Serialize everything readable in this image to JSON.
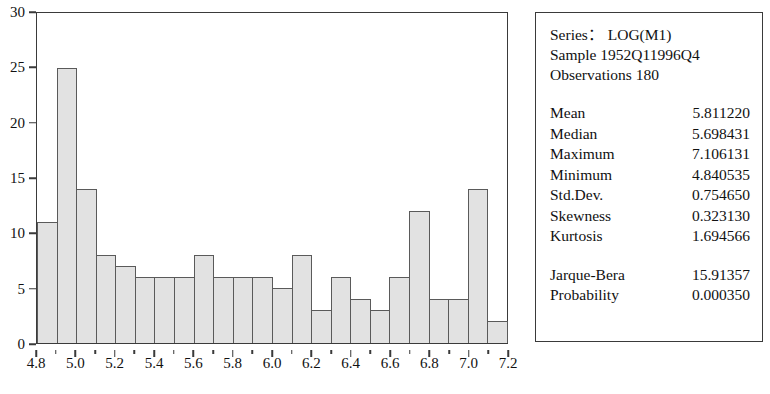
{
  "chart_data": {
    "type": "bar",
    "title": "",
    "xlabel": "",
    "ylabel": "",
    "ylim": [
      0,
      30
    ],
    "xlim": [
      4.75,
      7.15
    ],
    "grid": false,
    "legend": null,
    "bin_width": 0.1,
    "categories": [
      "4.75",
      "4.85",
      "4.95",
      "5.05",
      "5.15",
      "5.25",
      "5.35",
      "5.45",
      "5.55",
      "5.65",
      "5.75",
      "5.85",
      "5.95",
      "6.05",
      "6.15",
      "6.25",
      "6.35",
      "6.45",
      "6.55",
      "6.65",
      "6.75",
      "6.85",
      "6.95",
      "7.05"
    ],
    "values": [
      11,
      25,
      14,
      8,
      7,
      6,
      6,
      6,
      8,
      6,
      6,
      6,
      5,
      8,
      3,
      6,
      4,
      3,
      6,
      12,
      4,
      4,
      14,
      2
    ],
    "y_ticks": [
      "0",
      "5",
      "10",
      "15",
      "20",
      "25",
      "30"
    ],
    "y_tick_values": [
      0,
      5,
      10,
      15,
      20,
      25,
      30
    ],
    "x_ticks": [
      "4.8",
      "5.0",
      "5.2",
      "5.4",
      "5.6",
      "5.8",
      "6.0",
      "6.2",
      "6.4",
      "6.6",
      "6.8",
      "7.0",
      "7.2"
    ],
    "x_tick_values": [
      4.8,
      5.0,
      5.2,
      5.4,
      5.6,
      5.8,
      6.0,
      6.2,
      6.4,
      6.6,
      6.8,
      7.0,
      7.2
    ],
    "bar_fill_color": "#e2e2e2",
    "bar_border_color": "#5a5a5a",
    "axis_color": "#3a3a3a"
  },
  "stats": {
    "series_line": "Series： LOG(M1)",
    "sample_line": "Sample 1952Q11996Q4",
    "observations_line": "Observations 180",
    "rows": [
      {
        "label": "Mean",
        "value": "5.811220"
      },
      {
        "label": "Median",
        "value": "5.698431"
      },
      {
        "label": "Maximum",
        "value": "7.106131"
      },
      {
        "label": "Minimum",
        "value": "4.840535"
      },
      {
        "label": "Std.Dev.",
        "value": "0.754650"
      },
      {
        "label": "Skewness",
        "value": "0.323130"
      },
      {
        "label": "Kurtosis",
        "value": "1.694566"
      }
    ],
    "test_rows": [
      {
        "label": "Jarque-Bera",
        "value": "15.91357"
      },
      {
        "label": "Probability",
        "value": "0.000350"
      }
    ]
  }
}
